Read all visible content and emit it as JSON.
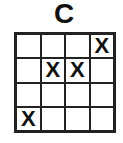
{
  "title": "C",
  "grid": {
    "rows": 4,
    "cols": 4,
    "cells": [
      [
        "",
        "",
        "",
        "X"
      ],
      [
        "",
        "X",
        "X",
        ""
      ],
      [
        "",
        "",
        "",
        ""
      ],
      [
        "X",
        "",
        "",
        ""
      ]
    ]
  }
}
